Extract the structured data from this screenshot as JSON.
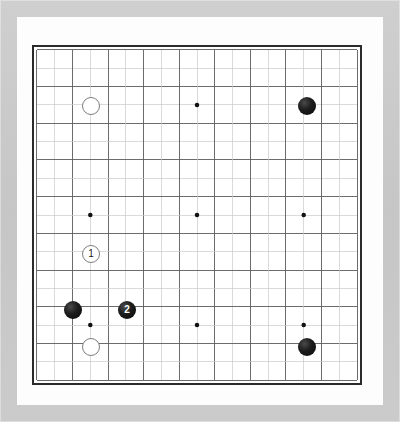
{
  "board": {
    "title": "Go Game Board",
    "size": 19,
    "size_label": "19x19",
    "frame_color": "#c9c9c9",
    "mat_color": "#fdfdfd",
    "board_color": "#ffffff",
    "border_color": "#2b2b2b",
    "grid_line_color": "#5a5a5a",
    "minor_line_color": "#c9c9c9",
    "star_point_color": "#111111",
    "black_stone_color": "#161616",
    "white_stone_color": "#ffffff",
    "white_stone_edge_color": "#7d7d7d",
    "star_points": [
      {
        "col": 4,
        "row": 4
      },
      {
        "col": 10,
        "row": 4
      },
      {
        "col": 16,
        "row": 4
      },
      {
        "col": 4,
        "row": 10
      },
      {
        "col": 10,
        "row": 10
      },
      {
        "col": 16,
        "row": 10
      },
      {
        "col": 4,
        "row": 16
      },
      {
        "col": 10,
        "row": 16
      },
      {
        "col": 16,
        "row": 16
      }
    ],
    "stones": [
      {
        "name": "white-stone-d16",
        "color": "white",
        "col": 4,
        "row": 4,
        "label": ""
      },
      {
        "name": "black-stone-q16",
        "color": "black",
        "col": 16,
        "row": 4,
        "label": ""
      },
      {
        "name": "white-stone-move-1",
        "color": "white",
        "col": 4,
        "row": 12,
        "label": "1"
      },
      {
        "name": "black-stone-c5",
        "color": "black",
        "col": 3,
        "row": 15,
        "label": ""
      },
      {
        "name": "black-stone-move-2",
        "color": "black",
        "col": 6,
        "row": 15,
        "label": "2"
      },
      {
        "name": "white-stone-d3",
        "color": "white",
        "col": 4,
        "row": 17,
        "label": ""
      },
      {
        "name": "black-stone-q3",
        "color": "black",
        "col": 16,
        "row": 17,
        "label": ""
      }
    ],
    "move_markers": [
      {
        "number": "1",
        "player": "white"
      },
      {
        "number": "2",
        "player": "black"
      }
    ]
  }
}
